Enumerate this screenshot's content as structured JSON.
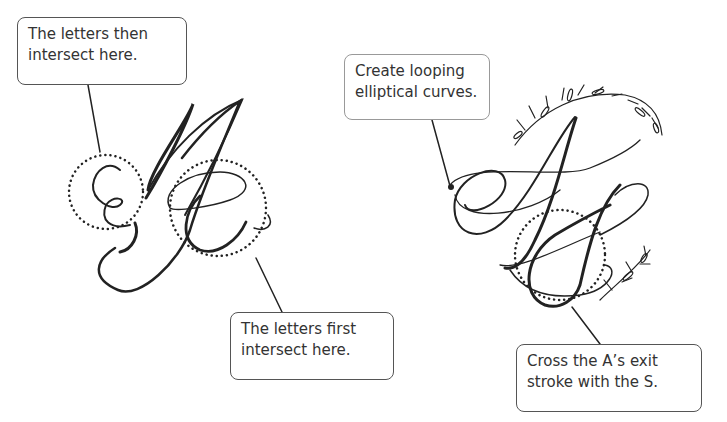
{
  "figure": {
    "left_monogram": {
      "letters": [
        "M",
        "G"
      ],
      "callouts": [
        {
          "id": "then",
          "lines": [
            "The letters then",
            "intersect here."
          ]
        },
        {
          "id": "first",
          "lines": [
            "The letters first",
            "intersect here."
          ]
        }
      ]
    },
    "right_monogram": {
      "letters": [
        "A",
        "S"
      ],
      "callouts": [
        {
          "id": "loop",
          "lines": [
            "Create looping",
            "elliptical curves."
          ]
        },
        {
          "id": "cross",
          "lines": [
            "Cross the A’s exit",
            "stroke with the S."
          ]
        }
      ]
    }
  }
}
